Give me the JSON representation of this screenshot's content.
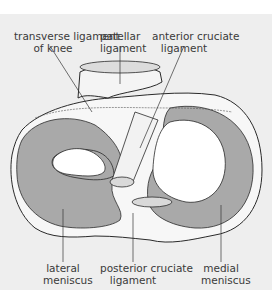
{
  "diagram": {
    "colors": {
      "background": "#eeeeee",
      "meniscus_fill": "#a9a9a9",
      "bone_fill": "#ffffff",
      "outline": "#2a2a2a",
      "label_text": "#3a3a3a"
    },
    "labels": {
      "transverse_ligament": {
        "line1": "transverse ligament",
        "line2": "of knee"
      },
      "patellar_ligament": {
        "line1": "patellar",
        "line2": "ligament"
      },
      "anterior_cruciate": {
        "line1": "anterior cruciate",
        "line2": "ligament"
      },
      "lateral_meniscus": {
        "line1": "lateral",
        "line2": "meniscus"
      },
      "posterior_cruciate": {
        "line1": "posterior cruciate",
        "line2": "ligament"
      },
      "medial_meniscus": {
        "line1": "medial",
        "line2": "meniscus"
      }
    }
  }
}
